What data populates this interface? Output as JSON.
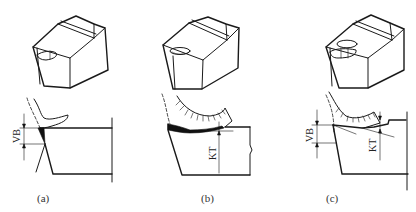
{
  "figure": {
    "panels": [
      {
        "id": "a",
        "caption": "(a)",
        "wear_type": "flank wear",
        "dimension_labels": [
          "VB"
        ]
      },
      {
        "id": "b",
        "caption": "(b)",
        "wear_type": "crater wear",
        "dimension_labels": [
          "KT"
        ]
      },
      {
        "id": "c",
        "caption": "(c)",
        "wear_type": "combined flank and crater wear",
        "dimension_labels": [
          "VB",
          "KT"
        ]
      }
    ]
  },
  "labels": {
    "a_vb": "VB",
    "b_kt": "KT",
    "c_vb": "VB",
    "c_kt": "KT"
  },
  "colors": {
    "line": "#1a1a1a",
    "background": "#ffffff"
  }
}
